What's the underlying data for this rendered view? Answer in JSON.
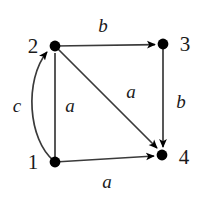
{
  "figure": {
    "kind": "directed-graph",
    "width": 200,
    "height": 198,
    "background_color": "#ffffff",
    "stroke_color": "#3a3a3a",
    "node_color": "#000000",
    "text_color": "#1a1a1a"
  },
  "nodes": [
    {
      "id": "1",
      "label": "1",
      "x": 55,
      "y": 162,
      "label_x": 33,
      "label_y": 162
    },
    {
      "id": "2",
      "label": "2",
      "x": 55,
      "y": 46,
      "label_x": 33,
      "label_y": 46
    },
    {
      "id": "3",
      "label": "3",
      "x": 163,
      "y": 44,
      "label_x": 185,
      "label_y": 44
    },
    {
      "id": "4",
      "label": "4",
      "x": 162,
      "y": 155,
      "label_x": 184,
      "label_y": 157
    }
  ],
  "edges": [
    {
      "id": "e-2-3",
      "from": "2",
      "to": "3",
      "label": "b",
      "shape": "straight",
      "label_x": 103,
      "label_y": 25
    },
    {
      "id": "e-1-2-straight",
      "from": "1",
      "to": "2",
      "label": "a",
      "shape": "straight",
      "label_x": 70,
      "label_y": 105
    },
    {
      "id": "e-1-2-curved",
      "from": "1",
      "to": "2",
      "label": "c",
      "shape": "curved",
      "label_x": 17,
      "label_y": 105
    },
    {
      "id": "e-2-4",
      "from": "2",
      "to": "4",
      "label": "a",
      "shape": "diagonal",
      "label_x": 131,
      "label_y": 91
    },
    {
      "id": "e-3-4",
      "from": "3",
      "to": "4",
      "label": "b",
      "shape": "straight",
      "label_x": 181,
      "label_y": 101
    },
    {
      "id": "e-1-4",
      "from": "1",
      "to": "4",
      "label": "a",
      "shape": "straight",
      "label_x": 107,
      "label_y": 181
    }
  ]
}
